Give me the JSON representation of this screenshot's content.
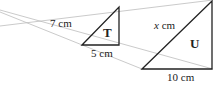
{
  "diagram": {
    "colors": {
      "shape_stroke": "#222222",
      "ray_stroke": "#bdbdbd",
      "background": "#ffffff"
    },
    "triangle_t": {
      "name": "T",
      "height_label": "7 cm",
      "base_label": "5 cm"
    },
    "triangle_u": {
      "name": "U",
      "hypotenuse_label_var": "x",
      "hypotenuse_label_unit": " cm",
      "base_label": "10 cm"
    }
  }
}
